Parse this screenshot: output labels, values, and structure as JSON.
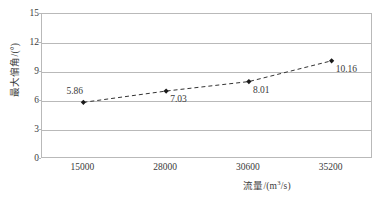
{
  "chart_data": {
    "type": "line",
    "title": "",
    "subtitle": "",
    "xlabel": "流量/(m³/s)",
    "ylabel": "最大偏角/(°)",
    "categories": [
      "15000",
      "28000",
      "30600",
      "35200"
    ],
    "x": [
      15000,
      28000,
      30600,
      35200
    ],
    "values": [
      5.86,
      7.03,
      8.01,
      10.16
    ],
    "point_labels": [
      "5.86",
      "7.03",
      "8.01",
      "10.16"
    ],
    "ylim": [
      0,
      15
    ],
    "yticks": [
      "0",
      "3",
      "6",
      "9",
      "12",
      "15"
    ],
    "xticks": [
      "15000",
      "28000",
      "30600",
      "35200"
    ],
    "grid": true,
    "legend": "none",
    "line_style": "dashed",
    "marker": "diamond",
    "colors": {
      "line": "#333333",
      "marker": "#1a1a1a",
      "grid": "#b9b9b9",
      "axis": "#b9b9b9",
      "text": "#3a3a3a",
      "background": "#ffffff"
    }
  }
}
